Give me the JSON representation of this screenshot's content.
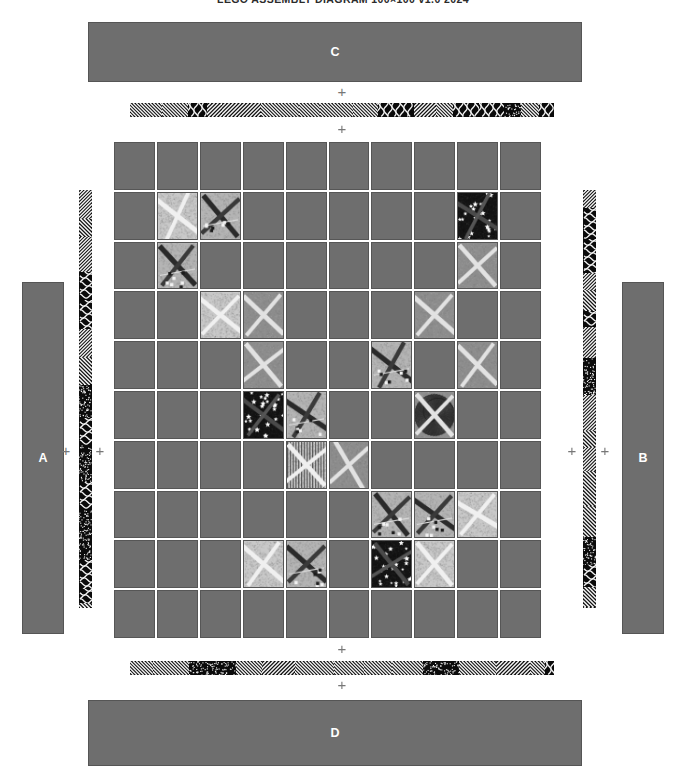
{
  "title": "LEGO ASSEMBLY DIAGRAM 100×100 v1.0 2024",
  "colors": {
    "bar_fill": "#6e6e6e",
    "bar_border": "#555555",
    "bar_label": "#ffffff",
    "cell_fill": "#6e6e6e",
    "cell_border": "#565656",
    "plus": "#777777",
    "strip_dark": "#0b0b0b",
    "strip_light": "#f2f2f2",
    "background": "#ffffff",
    "title_color": "#2b2b2b"
  },
  "bars": {
    "left": {
      "label": "A",
      "x": 22,
      "y": 282,
      "w": 42,
      "h": 352
    },
    "right": {
      "label": "B",
      "x": 622,
      "y": 282,
      "w": 42,
      "h": 352
    },
    "top": {
      "label": "C",
      "x": 88,
      "y": 22,
      "w": 494,
      "h": 60
    },
    "bottom": {
      "label": "D",
      "x": 88,
      "y": 700,
      "w": 494,
      "h": 66
    }
  },
  "strips": {
    "left": {
      "x": 79,
      "y": 190,
      "w": 13,
      "h": 418,
      "orientation": "vertical"
    },
    "right": {
      "x": 583,
      "y": 190,
      "w": 13,
      "h": 418,
      "orientation": "vertical"
    },
    "top": {
      "x": 130,
      "y": 103,
      "w": 424,
      "h": 14,
      "orientation": "horizontal"
    },
    "bottom": {
      "x": 130,
      "y": 661,
      "w": 424,
      "h": 14,
      "orientation": "horizontal"
    }
  },
  "plus_markers": [
    {
      "name": "plus-left-outer",
      "x": 66,
      "y": 450
    },
    {
      "name": "plus-left-inner",
      "x": 100,
      "y": 450
    },
    {
      "name": "plus-right-inner",
      "x": 572,
      "y": 450
    },
    {
      "name": "plus-right-outer",
      "x": 605,
      "y": 450
    },
    {
      "name": "plus-top-outer",
      "x": 342,
      "y": 91
    },
    {
      "name": "plus-top-inner",
      "x": 342,
      "y": 128
    },
    {
      "name": "plus-bottom-inner",
      "x": 342,
      "y": 648
    },
    {
      "name": "plus-bottom-outer",
      "x": 342,
      "y": 684
    }
  ],
  "grid": {
    "x": 114,
    "y": 142,
    "w": 427,
    "h": 496,
    "rows": 10,
    "cols": 10,
    "plain_label": "plain-tile",
    "image_label": "aerial-tile",
    "tiles": [
      [
        0,
        0,
        0,
        0,
        0,
        0,
        0,
        0,
        0,
        0
      ],
      [
        0,
        1,
        1,
        0,
        0,
        0,
        0,
        0,
        1,
        0
      ],
      [
        0,
        1,
        0,
        0,
        0,
        0,
        0,
        0,
        1,
        0
      ],
      [
        0,
        0,
        1,
        1,
        0,
        0,
        0,
        1,
        0,
        0
      ],
      [
        0,
        0,
        0,
        1,
        0,
        0,
        1,
        0,
        1,
        0
      ],
      [
        0,
        0,
        0,
        1,
        1,
        0,
        0,
        1,
        0,
        0
      ],
      [
        0,
        0,
        0,
        0,
        1,
        1,
        0,
        0,
        0,
        0
      ],
      [
        0,
        0,
        0,
        0,
        0,
        0,
        1,
        1,
        1,
        0
      ],
      [
        0,
        0,
        0,
        1,
        1,
        0,
        1,
        1,
        0,
        0
      ],
      [
        0,
        0,
        0,
        0,
        0,
        0,
        0,
        0,
        0,
        0
      ]
    ],
    "tile_styles": [
      {
        "r": 1,
        "c": 1,
        "style": "runway-cross-light"
      },
      {
        "r": 1,
        "c": 2,
        "style": "aircraft-dark"
      },
      {
        "r": 1,
        "c": 8,
        "style": "star-field-dark"
      },
      {
        "r": 2,
        "c": 1,
        "style": "aircraft-dark"
      },
      {
        "r": 2,
        "c": 8,
        "style": "runway-cross-mid"
      },
      {
        "r": 3,
        "c": 2,
        "style": "runway-cross-light"
      },
      {
        "r": 3,
        "c": 3,
        "style": "runway-cross-mid"
      },
      {
        "r": 3,
        "c": 7,
        "style": "runway-cross-mid"
      },
      {
        "r": 4,
        "c": 3,
        "style": "runway-cross-mid"
      },
      {
        "r": 4,
        "c": 6,
        "style": "aircraft-dark"
      },
      {
        "r": 4,
        "c": 8,
        "style": "runway-cross-mid"
      },
      {
        "r": 5,
        "c": 3,
        "style": "star-field-dark"
      },
      {
        "r": 5,
        "c": 4,
        "style": "aircraft-dark"
      },
      {
        "r": 5,
        "c": 7,
        "style": "hatched-swirl"
      },
      {
        "r": 6,
        "c": 4,
        "style": "striped-cross"
      },
      {
        "r": 6,
        "c": 5,
        "style": "runway-cross-mid"
      },
      {
        "r": 7,
        "c": 6,
        "style": "aircraft-dark"
      },
      {
        "r": 7,
        "c": 7,
        "style": "aircraft-dark"
      },
      {
        "r": 7,
        "c": 8,
        "style": "runway-cross-light"
      },
      {
        "r": 8,
        "c": 3,
        "style": "runway-cross-light"
      },
      {
        "r": 8,
        "c": 4,
        "style": "aircraft-dark"
      },
      {
        "r": 8,
        "c": 6,
        "style": "star-field-dark"
      },
      {
        "r": 8,
        "c": 7,
        "style": "runway-cross-light"
      }
    ]
  }
}
